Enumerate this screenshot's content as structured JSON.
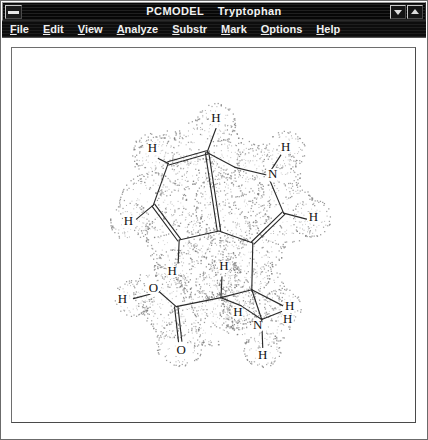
{
  "window": {
    "title": "PCMODEL    Tryptophan",
    "app_name": "PCMODEL",
    "document_name": "Tryptophan",
    "sysmenu_icon": "window-menu-icon",
    "minimize_icon": "minimize-arrow-icon",
    "maximize_icon": "maximize-arrow-icon",
    "titlebar_color": "#070707",
    "titlebar_text_color": "#f2f2f2",
    "client_background": "#ffffff"
  },
  "menu": {
    "items": [
      {
        "label": "File",
        "accel": "F",
        "rest": "ile"
      },
      {
        "label": "Edit",
        "accel": "E",
        "rest": "dit"
      },
      {
        "label": "View",
        "accel": "V",
        "rest": "iew"
      },
      {
        "label": "Analyze",
        "accel": "A",
        "rest": "nalyze"
      },
      {
        "label": "Substr",
        "accel": "S",
        "rest": "ubstr"
      },
      {
        "label": "Mark",
        "accel": "M",
        "rest": "ark"
      },
      {
        "label": "Options",
        "accel": "O",
        "rest": "ptions"
      },
      {
        "label": "Help",
        "accel": "H",
        "rest": "elp"
      }
    ]
  },
  "molecule": {
    "name": "Tryptophan",
    "render_style": "wireframe-with-dot-surface",
    "bond_color": "#2a2a2a",
    "label_color": "#111111",
    "dot_color": "#7d7d7d",
    "atom_labels": [
      {
        "id": "H-c4",
        "text": "H",
        "x": 216,
        "y": 118
      },
      {
        "id": "H-c5",
        "text": "H",
        "x": 152,
        "y": 149
      },
      {
        "id": "H-n1",
        "text": "H",
        "x": 286,
        "y": 148
      },
      {
        "id": "H-c6",
        "text": "H",
        "x": 128,
        "y": 222
      },
      {
        "id": "N-1",
        "text": "N",
        "x": 273,
        "y": 175
      },
      {
        "id": "H-c2",
        "text": "H",
        "x": 314,
        "y": 218
      },
      {
        "id": "H-c7",
        "text": "H",
        "x": 172,
        "y": 272
      },
      {
        "id": "H-beta",
        "text": "H",
        "x": 224,
        "y": 267
      },
      {
        "id": "O-hydroxyl",
        "text": "O",
        "x": 153,
        "y": 289
      },
      {
        "id": "H-hydroxyl",
        "text": "H",
        "x": 122,
        "y": 300
      },
      {
        "id": "H-alpha",
        "text": "H",
        "x": 238,
        "y": 313
      },
      {
        "id": "H-n2a",
        "text": "H",
        "x": 290,
        "y": 307
      },
      {
        "id": "H-n2b",
        "text": "H",
        "x": 288,
        "y": 320
      },
      {
        "id": "N-2",
        "text": "N",
        "x": 258,
        "y": 327
      },
      {
        "id": "H-n2c",
        "text": "H",
        "x": 263,
        "y": 357
      },
      {
        "id": "O-carbonyl",
        "text": "O",
        "x": 181,
        "y": 352
      }
    ],
    "bonds": [
      {
        "from": [
          216,
          128
        ],
        "to": [
          207,
          152
        ],
        "order": 1
      },
      {
        "from": [
          207,
          152
        ],
        "to": [
          168,
          163
        ],
        "order": 2
      },
      {
        "from": [
          168,
          163
        ],
        "to": [
          158,
          158
        ],
        "order": 1
      },
      {
        "from": [
          168,
          163
        ],
        "to": [
          153,
          205
        ],
        "order": 1
      },
      {
        "from": [
          153,
          205
        ],
        "to": [
          136,
          219
        ],
        "order": 1
      },
      {
        "from": [
          153,
          205
        ],
        "to": [
          179,
          240
        ],
        "order": 2
      },
      {
        "from": [
          179,
          240
        ],
        "to": [
          178,
          263
        ],
        "order": 1
      },
      {
        "from": [
          179,
          240
        ],
        "to": [
          219,
          231
        ],
        "order": 1
      },
      {
        "from": [
          219,
          231
        ],
        "to": [
          207,
          152
        ],
        "order": 2
      },
      {
        "from": [
          207,
          152
        ],
        "to": [
          235,
          167
        ],
        "order": 1
      },
      {
        "from": [
          235,
          167
        ],
        "to": [
          268,
          175
        ],
        "order": 1
      },
      {
        "from": [
          268,
          175
        ],
        "to": [
          281,
          155
        ],
        "order": 1
      },
      {
        "from": [
          268,
          175
        ],
        "to": [
          284,
          213
        ],
        "order": 1
      },
      {
        "from": [
          284,
          213
        ],
        "to": [
          307,
          219
        ],
        "order": 1
      },
      {
        "from": [
          284,
          213
        ],
        "to": [
          253,
          243
        ],
        "order": 2
      },
      {
        "from": [
          253,
          243
        ],
        "to": [
          219,
          231
        ],
        "order": 1
      },
      {
        "from": [
          253,
          243
        ],
        "to": [
          252,
          290
        ],
        "order": 1
      },
      {
        "from": [
          252,
          290
        ],
        "to": [
          221,
          298
        ],
        "order": 1
      },
      {
        "from": [
          221,
          298
        ],
        "to": [
          222,
          277
        ],
        "order": 1
      },
      {
        "from": [
          221,
          298
        ],
        "to": [
          176,
          307
        ],
        "order": 1
      },
      {
        "from": [
          176,
          307
        ],
        "to": [
          159,
          292
        ],
        "order": 1
      },
      {
        "from": [
          159,
          292
        ],
        "to": [
          133,
          299
        ],
        "order": 1
      },
      {
        "from": [
          176,
          307
        ],
        "to": [
          180,
          342
        ],
        "order": 2
      },
      {
        "from": [
          221,
          298
        ],
        "to": [
          241,
          306
        ],
        "order": 1
      },
      {
        "from": [
          252,
          290
        ],
        "to": [
          283,
          306
        ],
        "order": 1
      },
      {
        "from": [
          252,
          290
        ],
        "to": [
          262,
          320
        ],
        "order": 1
      },
      {
        "from": [
          262,
          320
        ],
        "to": [
          282,
          312
        ],
        "order": 1
      },
      {
        "from": [
          262,
          320
        ],
        "to": [
          263,
          348
        ],
        "order": 1
      },
      {
        "from": [
          241,
          306
        ],
        "to": [
          262,
          320
        ],
        "order": 1
      }
    ]
  }
}
